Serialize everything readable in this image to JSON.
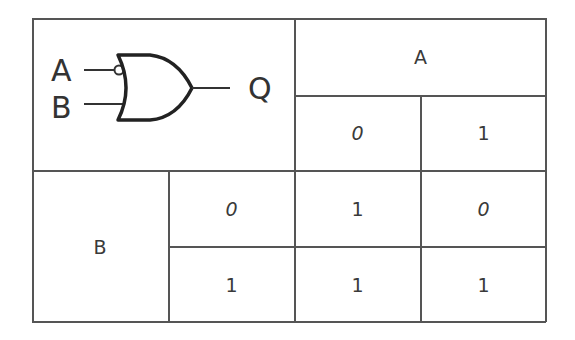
{
  "gate": {
    "type": "OR gate with inverted input A",
    "input_a_label": "A",
    "input_b_label": "B",
    "output_label": "Q",
    "inverted_input": "A"
  },
  "table": {
    "column_header": "A",
    "row_header": "B",
    "column_values": [
      "0",
      "1"
    ],
    "row_values": [
      "0",
      "1"
    ],
    "outputs": [
      [
        "1",
        "0"
      ],
      [
        "1",
        "1"
      ]
    ]
  }
}
